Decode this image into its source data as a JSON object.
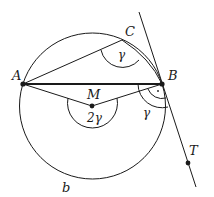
{
  "diagram": {
    "title": "",
    "points": {
      "A": {
        "label": "A",
        "x": 23,
        "y": 84
      },
      "B": {
        "label": "B",
        "x": 162,
        "y": 84
      },
      "C": {
        "label": "C",
        "x": 122,
        "y": 40
      },
      "M": {
        "label": "M",
        "x": 92,
        "y": 106
      },
      "T": {
        "label": "T",
        "x": 188,
        "y": 163
      }
    },
    "circle": {
      "cx": 92,
      "cy": 106,
      "r": 73
    },
    "angles": {
      "inscribed": "γ",
      "central": "2γ",
      "tangent_chord": "γ",
      "right_angle_mark": "·"
    },
    "arc_label": "b",
    "colors": {
      "stroke": "#1a1a1a",
      "background": "#ffffff"
    }
  }
}
